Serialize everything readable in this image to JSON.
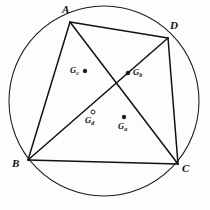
{
  "figure": {
    "type": "geometry-diagram",
    "background_color": "#fdfdfc",
    "ink_color": "#111111"
  },
  "circle": {
    "name": "circumcircle",
    "center_x": 104,
    "center_y": 101,
    "radius": 95,
    "stroke_color": "#1a1a1a",
    "stroke_width": 1.05
  },
  "vertices": [
    {
      "id": "A",
      "label": "A",
      "x": 70,
      "y": 22,
      "label_x": 62,
      "label_y": 4
    },
    {
      "id": "D",
      "label": "D",
      "x": 168,
      "y": 38,
      "label_x": 170,
      "label_y": 20
    },
    {
      "id": "B",
      "label": "B",
      "x": 28,
      "y": 160,
      "label_x": 12,
      "label_y": 158
    },
    {
      "id": "C",
      "label": "C",
      "x": 178,
      "y": 164,
      "label_x": 182,
      "label_y": 163
    }
  ],
  "segments": [
    {
      "id": "AB",
      "kind": "side",
      "from": "A",
      "to": "B",
      "x1": 70,
      "y1": 22,
      "x2": 28,
      "y2": 160
    },
    {
      "id": "AD",
      "kind": "side",
      "from": "A",
      "to": "D",
      "x1": 70,
      "y1": 22,
      "x2": 168,
      "y2": 38
    },
    {
      "id": "DC",
      "kind": "side",
      "from": "D",
      "to": "C",
      "x1": 168,
      "y1": 38,
      "x2": 178,
      "y2": 164
    },
    {
      "id": "BC",
      "kind": "side",
      "from": "B",
      "to": "C",
      "x1": 28,
      "y1": 160,
      "x2": 178,
      "y2": 164
    },
    {
      "id": "AC",
      "kind": "diagonal",
      "from": "A",
      "to": "C",
      "x1": 70,
      "y1": 22,
      "x2": 178,
      "y2": 164
    },
    {
      "id": "BD",
      "kind": "diagonal",
      "from": "B",
      "to": "D",
      "x1": 28,
      "y1": 160,
      "x2": 168,
      "y2": 38
    }
  ],
  "interior_points": [
    {
      "id": "Gc",
      "base": "G",
      "sub": "c",
      "marker": "filled",
      "x": 85,
      "y": 71,
      "label_x": 70,
      "label_y": 66
    },
    {
      "id": "Gb",
      "base": "G",
      "sub": "b",
      "marker": "filled",
      "x": 128,
      "y": 73,
      "label_x": 133,
      "label_y": 68
    },
    {
      "id": "Gd",
      "base": "G",
      "sub": "d",
      "marker": "hollow",
      "x": 93,
      "y": 112,
      "label_x": 85,
      "label_y": 116
    },
    {
      "id": "Ga",
      "base": "G",
      "sub": "a",
      "marker": "filled",
      "x": 124,
      "y": 117,
      "label_x": 118,
      "label_y": 122
    }
  ]
}
